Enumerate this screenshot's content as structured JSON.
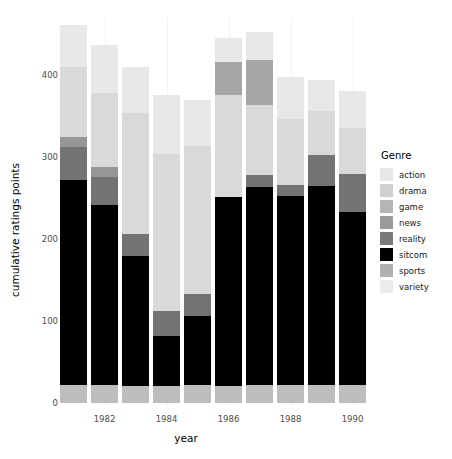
{
  "chart_data": {
    "type": "bar",
    "stacked": true,
    "title": "",
    "xlabel": "year",
    "ylabel": "cumulative ratings points",
    "categories": [
      1981,
      1982,
      1983,
      1984,
      1985,
      1986,
      1987,
      1988,
      1989,
      1990
    ],
    "x_tick_labels": [
      "1982",
      "1984",
      "1986",
      "1988",
      "1990"
    ],
    "x_tick_values": [
      1982,
      1984,
      1986,
      1988,
      1990
    ],
    "y_tick_labels": [
      "0",
      "100",
      "200",
      "300",
      "400"
    ],
    "y_tick_values": [
      0,
      100,
      200,
      300,
      400
    ],
    "ylim": [
      0,
      465
    ],
    "grid": "vertical-only",
    "legend_position": "right",
    "legend_title": "Genre",
    "series": [
      {
        "name": "variety",
        "color": "#bdbdbd",
        "values": [
          22,
          22,
          21,
          21,
          22,
          21,
          22,
          22,
          22,
          22
        ]
      },
      {
        "name": "sitcom",
        "color": "#000000",
        "values": [
          250,
          220,
          159,
          61,
          84,
          230,
          242,
          231,
          243,
          211
        ]
      },
      {
        "name": "reality",
        "color": "#737373",
        "values": [
          40,
          34,
          26,
          30,
          27,
          0,
          14,
          13,
          38,
          46
        ]
      },
      {
        "name": "news",
        "color": "#969696",
        "values": [
          13,
          12,
          0,
          0,
          0,
          0,
          0,
          0,
          0,
          0
        ]
      },
      {
        "name": "game",
        "color": "#d9d9d9",
        "values": [
          85,
          90,
          148,
          192,
          181,
          125,
          86,
          81,
          53,
          57
        ]
      },
      {
        "name": "drama",
        "color": "#a6a6a6",
        "values": [
          0,
          0,
          0,
          0,
          0,
          40,
          55,
          0,
          0,
          0
        ]
      },
      {
        "name": "action",
        "color": "#e8e8e8",
        "values": [
          51,
          59,
          56,
          72,
          56,
          30,
          34,
          51,
          38,
          45
        ]
      }
    ],
    "totals": [
      461,
      437,
      410,
      376,
      370,
      446,
      453,
      398,
      394,
      381
    ],
    "legend_entries": [
      {
        "label": "action",
        "color": "#e8e8e8"
      },
      {
        "label": "drama",
        "color": "#d0d0d0"
      },
      {
        "label": "game",
        "color": "#b5b5b5"
      },
      {
        "label": "news",
        "color": "#9a9a9a"
      },
      {
        "label": "reality",
        "color": "#7a7a7a"
      },
      {
        "label": "sitcom",
        "color": "#000000"
      },
      {
        "label": "sports",
        "color": "#b0b0b0"
      },
      {
        "label": "variety",
        "color": "#ececec"
      }
    ]
  }
}
